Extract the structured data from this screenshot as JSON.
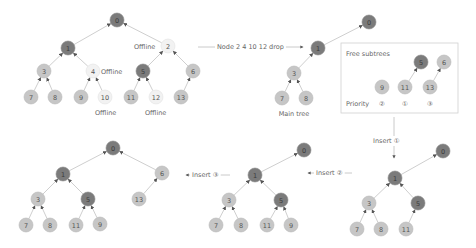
{
  "diagram": {
    "panels": [
      {
        "id": "original-tree",
        "nodes": [
          {
            "id": "0",
            "x": 117,
            "y": 20,
            "state": "dark"
          },
          {
            "id": "1",
            "x": 68,
            "y": 48,
            "state": "dark"
          },
          {
            "id": "2",
            "x": 168,
            "y": 46,
            "state": "offline"
          },
          {
            "id": "3",
            "x": 44,
            "y": 71,
            "state": "light"
          },
          {
            "id": "4",
            "x": 93,
            "y": 71,
            "state": "offline"
          },
          {
            "id": "5",
            "x": 143,
            "y": 71,
            "state": "dark"
          },
          {
            "id": "6",
            "x": 193,
            "y": 71,
            "state": "light"
          },
          {
            "id": "7",
            "x": 31,
            "y": 97,
            "state": "light"
          },
          {
            "id": "8",
            "x": 55,
            "y": 97,
            "state": "light"
          },
          {
            "id": "9",
            "x": 81,
            "y": 97,
            "state": "light"
          },
          {
            "id": "10",
            "x": 105,
            "y": 97,
            "state": "offline"
          },
          {
            "id": "11",
            "x": 131,
            "y": 97,
            "state": "light"
          },
          {
            "id": "12",
            "x": 156,
            "y": 97,
            "state": "offline"
          },
          {
            "id": "13",
            "x": 181,
            "y": 97,
            "state": "light"
          }
        ],
        "edges": [
          [
            "1",
            "0"
          ],
          [
            "2",
            "0"
          ],
          [
            "3",
            "1"
          ],
          [
            "4",
            "1"
          ],
          [
            "5",
            "2"
          ],
          [
            "6",
            "2"
          ],
          [
            "7",
            "3"
          ],
          [
            "8",
            "3"
          ],
          [
            "9",
            "4"
          ],
          [
            "10",
            "4"
          ],
          [
            "11",
            "5"
          ],
          [
            "12",
            "5"
          ],
          [
            "13",
            "6"
          ]
        ],
        "labels": [
          {
            "text": "Offline",
            "x": 134,
            "y": 49
          },
          {
            "text": "Offline",
            "x": 101,
            "y": 74
          },
          {
            "text": "Offline",
            "x": 95,
            "y": 115
          },
          {
            "text": "Offline",
            "x": 145,
            "y": 115
          }
        ]
      },
      {
        "id": "main-tree",
        "caption": "Main tree",
        "caption_pos": {
          "x": 294,
          "y": 116
        },
        "nodes": [
          {
            "id": "0",
            "x": 369,
            "y": 22,
            "state": "dark"
          },
          {
            "id": "1",
            "x": 318,
            "y": 48,
            "state": "dark"
          },
          {
            "id": "3",
            "x": 294,
            "y": 73,
            "state": "light"
          },
          {
            "id": "7",
            "x": 282,
            "y": 98,
            "state": "light"
          },
          {
            "id": "8",
            "x": 306,
            "y": 98,
            "state": "light"
          }
        ],
        "edges": [
          [
            "1",
            "0"
          ],
          [
            "3",
            "1"
          ],
          [
            "7",
            "3"
          ],
          [
            "8",
            "3"
          ]
        ]
      },
      {
        "id": "free-subtrees",
        "title": "Free subtrees",
        "priority_label": "Priority",
        "box": {
          "x": 341,
          "y": 43,
          "w": 117,
          "h": 70
        },
        "nodes": [
          {
            "id": "5",
            "x": 421,
            "y": 62,
            "state": "dark"
          },
          {
            "id": "6",
            "x": 444,
            "y": 62,
            "state": "light"
          },
          {
            "id": "9",
            "x": 382,
            "y": 87,
            "state": "light"
          },
          {
            "id": "11",
            "x": 405,
            "y": 87,
            "state": "light"
          },
          {
            "id": "13",
            "x": 430,
            "y": 87,
            "state": "light"
          }
        ],
        "edges": [
          [
            "11",
            "5"
          ],
          [
            "13",
            "6"
          ]
        ],
        "priorities": [
          {
            "text": "②",
            "x": 382,
            "y": 104
          },
          {
            "text": "①",
            "x": 405,
            "y": 104
          },
          {
            "text": "③",
            "x": 430,
            "y": 104
          }
        ]
      },
      {
        "id": "after-insert-1",
        "nodes": [
          {
            "id": "0",
            "x": 443,
            "y": 151,
            "state": "dark"
          },
          {
            "id": "1",
            "x": 395,
            "y": 178,
            "state": "dark"
          },
          {
            "id": "3",
            "x": 369,
            "y": 203,
            "state": "light"
          },
          {
            "id": "5",
            "x": 418,
            "y": 203,
            "state": "dark"
          },
          {
            "id": "7",
            "x": 357,
            "y": 229,
            "state": "light"
          },
          {
            "id": "8",
            "x": 381,
            "y": 229,
            "state": "light"
          },
          {
            "id": "11",
            "x": 406,
            "y": 229,
            "state": "light"
          }
        ],
        "edges": [
          [
            "1",
            "0"
          ],
          [
            "3",
            "1"
          ],
          [
            "5",
            "1"
          ],
          [
            "7",
            "3"
          ],
          [
            "8",
            "3"
          ],
          [
            "11",
            "5"
          ]
        ]
      },
      {
        "id": "after-insert-2",
        "nodes": [
          {
            "id": "0",
            "x": 304,
            "y": 150,
            "state": "dark"
          },
          {
            "id": "1",
            "x": 255,
            "y": 175,
            "state": "dark"
          },
          {
            "id": "3",
            "x": 229,
            "y": 200,
            "state": "light"
          },
          {
            "id": "5",
            "x": 281,
            "y": 200,
            "state": "dark"
          },
          {
            "id": "7",
            "x": 216,
            "y": 225,
            "state": "light"
          },
          {
            "id": "8",
            "x": 241,
            "y": 225,
            "state": "light"
          },
          {
            "id": "11",
            "x": 267,
            "y": 225,
            "state": "light"
          },
          {
            "id": "9",
            "x": 291,
            "y": 225,
            "state": "light"
          }
        ],
        "edges": [
          [
            "1",
            "0"
          ],
          [
            "3",
            "1"
          ],
          [
            "5",
            "1"
          ],
          [
            "7",
            "3"
          ],
          [
            "8",
            "3"
          ],
          [
            "11",
            "5"
          ],
          [
            "9",
            "5"
          ]
        ]
      },
      {
        "id": "after-insert-3",
        "nodes": [
          {
            "id": "0",
            "x": 113,
            "y": 148,
            "state": "dark"
          },
          {
            "id": "1",
            "x": 63,
            "y": 174,
            "state": "dark"
          },
          {
            "id": "6",
            "x": 162,
            "y": 173,
            "state": "light"
          },
          {
            "id": "3",
            "x": 38,
            "y": 199,
            "state": "light"
          },
          {
            "id": "5",
            "x": 88,
            "y": 199,
            "state": "dark"
          },
          {
            "id": "13",
            "x": 139,
            "y": 199,
            "state": "light"
          },
          {
            "id": "7",
            "x": 26,
            "y": 225,
            "state": "light"
          },
          {
            "id": "8",
            "x": 50,
            "y": 225,
            "state": "light"
          },
          {
            "id": "11",
            "x": 76,
            "y": 225,
            "state": "light"
          },
          {
            "id": "9",
            "x": 100,
            "y": 224,
            "state": "light"
          }
        ],
        "edges": [
          [
            "1",
            "0"
          ],
          [
            "6",
            "0"
          ],
          [
            "3",
            "1"
          ],
          [
            "5",
            "1"
          ],
          [
            "13",
            "6"
          ],
          [
            "7",
            "3"
          ],
          [
            "8",
            "3"
          ],
          [
            "11",
            "5"
          ],
          [
            "9",
            "5"
          ]
        ]
      }
    ],
    "transitions": [
      {
        "label": "Node 2 4 10 12 drop",
        "x1": 198,
        "y1": 47,
        "x2": 303,
        "y2": 47,
        "label_x": 217,
        "label_y": 47,
        "dir": "right"
      },
      {
        "label": "Insert ①",
        "x1": 394,
        "y1": 117,
        "x2": 394,
        "y2": 158,
        "label_x": 373,
        "label_y": 141,
        "dir": "down"
      },
      {
        "label": "Insert ②",
        "x1": 352,
        "y1": 173,
        "x2": 308,
        "y2": 173,
        "label_x": 316,
        "label_y": 173,
        "dir": "left"
      },
      {
        "label": "Insert ③",
        "x1": 230,
        "y1": 175,
        "x2": 186,
        "y2": 175,
        "label_x": 192,
        "label_y": 175,
        "dir": "left"
      }
    ],
    "colors": {
      "dark_node": "#7b7b7b",
      "light_node": "#c6c6c6",
      "offline_node": "#f2f2f2",
      "edge": "#cfcfcf",
      "text": "#666666"
    }
  }
}
